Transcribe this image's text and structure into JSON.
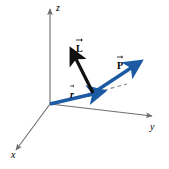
{
  "figure": {
    "background_color": "#ffffff",
    "axis_color": "#6e6e6e",
    "vector_colors": {
      "position_momentum": "#1c5ba4",
      "angular_momentum": "#111111",
      "dashed_reference": "#8a8a8a"
    }
  },
  "axes": [
    {
      "id": "z-axis",
      "label": "z",
      "direction": "up",
      "label_x": 56,
      "label_y": 3,
      "line": {
        "x1": 50,
        "y1": 104,
        "x2": 50,
        "y2": 9
      }
    },
    {
      "id": "y-axis",
      "label": "y",
      "direction": "right",
      "label_x": 150,
      "label_y": 124,
      "line": {
        "x1": 50,
        "y1": 104,
        "x2": 152,
        "y2": 116
      }
    },
    {
      "id": "x-axis",
      "label": "x",
      "direction": "lower-left",
      "label_x": 11,
      "label_y": 152,
      "line": {
        "x1": 50,
        "y1": 104,
        "x2": 16,
        "y2": 150
      }
    }
  ],
  "vectors": [
    {
      "id": "r-vector",
      "label": "r",
      "color": "#1c5ba4",
      "description": "position vector from origin",
      "line": {
        "x1": 50,
        "y1": 104,
        "x2": 99,
        "y2": 92
      },
      "label_x": 70,
      "label_y": 84,
      "label_width": 7
    },
    {
      "id": "p-vector",
      "label": "P",
      "color": "#1c5ba4",
      "description": "linear momentum vector",
      "line": {
        "x1": 93,
        "y1": 93,
        "x2": 141,
        "y2": 61
      },
      "label_x": 117,
      "label_y": 55,
      "label_width": 9
    },
    {
      "id": "l-vector",
      "label": "L",
      "color": "#111111",
      "description": "angular momentum vector",
      "line": {
        "x1": 93,
        "y1": 93,
        "x2": 71,
        "y2": 49
      },
      "label_x": 76,
      "label_y": 38,
      "label_width": 8
    }
  ],
  "dashed_reference": {
    "id": "dashed-line",
    "color": "#8a8a8a",
    "line": {
      "x1": 97,
      "y1": 92,
      "x2": 127,
      "y2": 84
    }
  },
  "origin": {
    "x": 50,
    "y": 104
  }
}
